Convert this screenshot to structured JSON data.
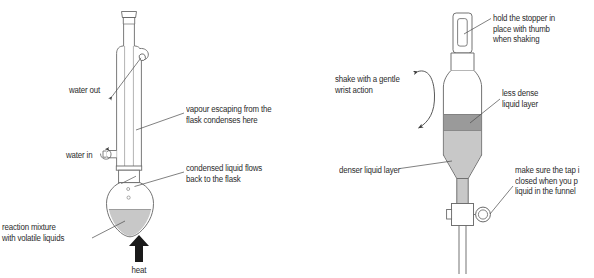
{
  "figure": {
    "background_color": "#ffffff",
    "glass_outline_color": "#6b6b6b",
    "glass_fill_color": "#ffffff",
    "liquid_light_color": "#c8c8c8",
    "liquid_dark_color": "#9a9a9a",
    "text_color": "#2b2b2b",
    "leader_line_color": "#4a4a4a",
    "arrow_black_color": "#1a1a1a"
  },
  "left_diagram": {
    "name": "reflux-condenser-apparatus",
    "labels": [
      {
        "id": "water-out",
        "text": "water out",
        "x": 69,
        "y": 85,
        "align": "left"
      },
      {
        "id": "vapour-escaping",
        "line1": "vapour escaping from the",
        "line2": "flask condenses here",
        "x": 186,
        "y": 104,
        "align": "left"
      },
      {
        "id": "water-in",
        "text": "water in",
        "x": 66,
        "y": 150,
        "align": "left"
      },
      {
        "id": "condensed-liquid",
        "line1": "condensed liquid flows",
        "line2": "back to the flask",
        "x": 186,
        "y": 163,
        "align": "left"
      },
      {
        "id": "reaction-mixture",
        "line1": "reaction mixture",
        "line2": "with volatile liquids",
        "x": 2,
        "y": 222,
        "align": "left"
      },
      {
        "id": "heat",
        "text": "heat",
        "x": 139,
        "y": 265,
        "align": "center"
      }
    ],
    "parts": [
      "ground-glass-joint-top",
      "condenser-outer-jacket",
      "condenser-inner-tube",
      "water-out-side-arm",
      "water-in-side-arm",
      "flask-neck-joint",
      "pear-shaped-flask",
      "reaction-liquid",
      "heat-arrow"
    ]
  },
  "right_diagram": {
    "name": "separating-funnel-apparatus",
    "labels": [
      {
        "id": "hold-stopper",
        "line1": "hold the stopper in",
        "line2": "place with thumb",
        "line3": "when shaking",
        "x": 493,
        "y": 13,
        "align": "left"
      },
      {
        "id": "shake-gentle",
        "line1": "shake with a gentle",
        "line2": "wrist action",
        "x": 335,
        "y": 74,
        "align": "left"
      },
      {
        "id": "less-dense",
        "line1": "less dense",
        "line2": "liquid layer",
        "x": 502,
        "y": 88,
        "align": "left"
      },
      {
        "id": "denser-liquid",
        "text": "denser liquid layer",
        "x": 339,
        "y": 165,
        "align": "left"
      },
      {
        "id": "tap-closed",
        "line1": "make sure the tap i",
        "line2": "closed when you p",
        "line3": "liquid in the funnel",
        "x": 515,
        "y": 165,
        "align": "left"
      }
    ],
    "parts": [
      "stopper",
      "funnel-neck",
      "funnel-body",
      "less-dense-liquid-layer",
      "denser-liquid-layer",
      "funnel-taper",
      "funnel-stem-upper",
      "stopcock-tap",
      "tap-handle",
      "funnel-stem-lower",
      "shake-arrow"
    ]
  }
}
